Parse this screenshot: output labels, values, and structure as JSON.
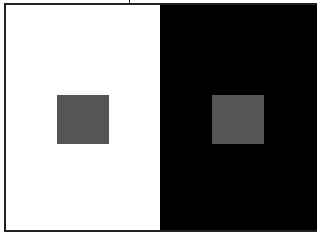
{
  "illusion": {
    "name": "simultaneous contrast",
    "left_panel": {
      "background": "#ffffff",
      "square_color": "#555555"
    },
    "right_panel": {
      "background": "#000000",
      "square_color": "#555555"
    },
    "border_color": "#222222"
  }
}
